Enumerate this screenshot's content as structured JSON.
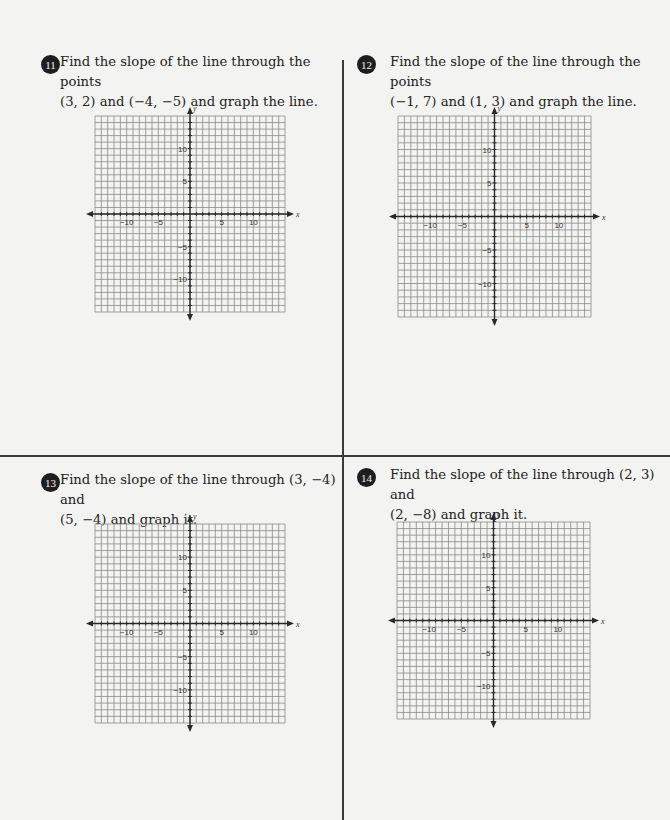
{
  "problems": [
    {
      "number": "11",
      "line1": "Find the slope of the line through the points",
      "line2": "(3, 2) and (−4, −5) and graph the line.",
      "graph": {
        "left": 95,
        "top": 116,
        "width": 190,
        "height": 196
      }
    },
    {
      "number": "12",
      "line1": "Find the slope of the line through the points",
      "line2": "(−1, 7) and (1, 3) and graph the line.",
      "graph": {
        "left": 398,
        "top": 116,
        "width": 193,
        "height": 201
      }
    },
    {
      "number": "13",
      "line1": "Find the slope of the line through (3, −4) and",
      "line2": "(5, −4) and graph it.",
      "graph": {
        "left": 95,
        "top": 524,
        "width": 190,
        "height": 199
      }
    },
    {
      "number": "14",
      "line1": "Find the slope of the line through (2, 3) and",
      "line2": "(2, −8) and graph it.",
      "graph": {
        "left": 397,
        "top": 522,
        "width": 193,
        "height": 197
      }
    }
  ],
  "grid": {
    "range": [
      -15,
      15
    ],
    "x_tick_labels": [
      "−10",
      "−5",
      "5",
      "10"
    ],
    "y_tick_labels": [
      "10",
      "5",
      "−5",
      "−10"
    ],
    "x_label": "x",
    "y_label": "y",
    "line_color": "#8a8a8a",
    "axis_color": "#2a2a2a"
  }
}
